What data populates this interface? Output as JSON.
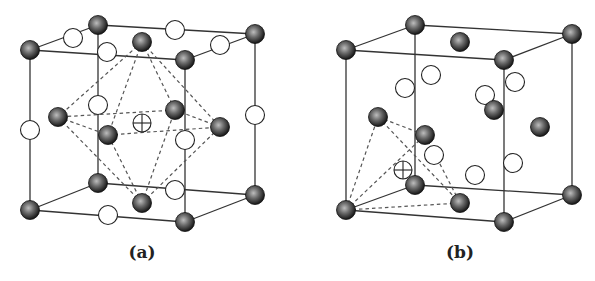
{
  "figure": {
    "panels": [
      {
        "id": "a",
        "label": "(a)",
        "description": "Unit cell with octahedral interstitial site highlighted at body center",
        "cube_corners": {
          "back": [
            [
              98,
              25
            ],
            [
              255,
              34
            ],
            [
              255,
              195
            ],
            [
              98,
              183
            ]
          ],
          "front": [
            [
              30,
              50
            ],
            [
              185,
              60
            ],
            [
              185,
              222
            ],
            [
              30,
              210
            ]
          ]
        },
        "dark_atoms": [
          [
            30,
            50
          ],
          [
            98,
            25
          ],
          [
            142,
            42
          ],
          [
            185,
            60
          ],
          [
            255,
            34
          ],
          [
            58,
            117
          ],
          [
            108,
            135
          ],
          [
            175,
            110
          ],
          [
            220,
            127
          ],
          [
            98,
            183
          ],
          [
            142,
            203
          ],
          [
            30,
            210
          ],
          [
            185,
            222
          ],
          [
            255,
            195
          ]
        ],
        "white_atoms": [
          [
            73,
            38
          ],
          [
            175,
            30
          ],
          [
            220,
            45
          ],
          [
            107,
            52
          ],
          [
            98,
            105
          ],
          [
            30,
            130
          ],
          [
            255,
            115
          ],
          [
            185,
            140
          ],
          [
            175,
            190
          ],
          [
            108,
            215
          ]
        ],
        "interstitial": [
          142,
          123
        ],
        "site_type": "octahedral",
        "dashed_polyhedron": {
          "apexes": [
            [
              142,
              42
            ],
            [
              142,
              203
            ]
          ],
          "equator": [
            [
              58,
              117
            ],
            [
              108,
              135
            ],
            [
              220,
              127
            ],
            [
              175,
              110
            ]
          ]
        }
      },
      {
        "id": "b",
        "label": "(b)",
        "description": "Unit cell with tetrahedral interstitial site highlighted near corner",
        "cube_corners": {
          "back": [
            [
              415,
              25
            ],
            [
              572,
              34
            ],
            [
              572,
              195
            ],
            [
              415,
              185
            ]
          ],
          "front": [
            [
              346,
              50
            ],
            [
              504,
              60
            ],
            [
              504,
              222
            ],
            [
              346,
              210
            ]
          ]
        },
        "dark_atoms": [
          [
            346,
            50
          ],
          [
            415,
            25
          ],
          [
            460,
            42
          ],
          [
            504,
            60
          ],
          [
            572,
            34
          ],
          [
            378,
            117
          ],
          [
            425,
            135
          ],
          [
            494,
            110
          ],
          [
            540,
            127
          ],
          [
            415,
            185
          ],
          [
            460,
            203
          ],
          [
            346,
            210
          ],
          [
            504,
            222
          ],
          [
            572,
            195
          ]
        ],
        "white_atoms": [
          [
            431,
            75
          ],
          [
            405,
            88
          ],
          [
            485,
            95
          ],
          [
            515,
            82
          ],
          [
            434,
            155
          ],
          [
            513,
            163
          ],
          [
            475,
            175
          ]
        ],
        "interstitial": [
          403,
          170
        ],
        "site_type": "tetrahedral",
        "dashed_polyhedron": {
          "vertices": [
            [
              346,
              210
            ],
            [
              378,
              117
            ],
            [
              425,
              135
            ],
            [
              460,
              203
            ]
          ]
        }
      }
    ],
    "legend_semantics": {
      "dark_sphere": "metal atom",
      "white_circle": "atom / site",
      "crossed_circle": "interstitial site"
    }
  }
}
